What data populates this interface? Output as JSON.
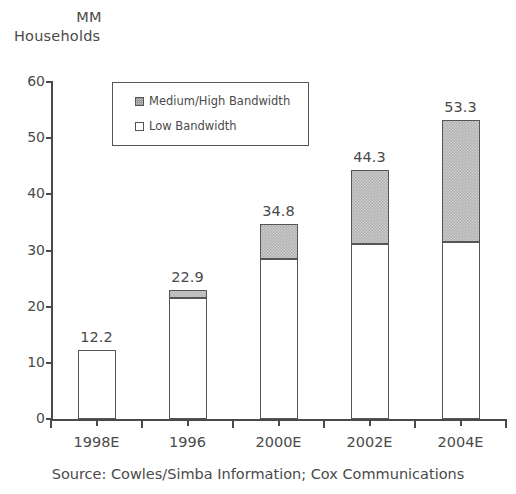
{
  "axis_title": {
    "line1": "MM",
    "line2": "Households"
  },
  "source": "Source: Cowles/Simba Information; Cox Communications",
  "legend": {
    "items": [
      {
        "label": "Medium/High Bandwidth",
        "swatch": "gray-hatched-square-icon",
        "color": "#b3b3b3"
      },
      {
        "label": "Low Bandwidth",
        "swatch": "white-square-icon",
        "color": "#ffffff"
      }
    ]
  },
  "chart_data": {
    "type": "bar",
    "subtype": "stacked",
    "title": "MM Households",
    "xlabel": "",
    "ylabel": "MM Households",
    "ylim": [
      0,
      60
    ],
    "yticks": [
      0,
      10,
      20,
      30,
      40,
      50,
      60
    ],
    "ytick_labels": [
      "0",
      "10",
      "20",
      "30",
      "40",
      "50",
      "60"
    ],
    "grid": false,
    "legend_position": "inside-top-left",
    "categories": [
      "1998E",
      "1996",
      "2000E",
      "2002E",
      "2004E"
    ],
    "series": [
      {
        "name": "Low Bandwidth",
        "color": "#ffffff",
        "values": [
          12.2,
          21.5,
          28.5,
          31.2,
          31.6
        ]
      },
      {
        "name": "Medium/High Bandwidth",
        "color": "#b3b3b3",
        "values": [
          0.0,
          1.4,
          6.3,
          13.1,
          21.7
        ]
      }
    ],
    "totals": [
      12.2,
      22.9,
      34.8,
      44.3,
      53.3
    ],
    "data_labels": [
      "12.2",
      "22.9",
      "34.8",
      "44.3",
      "53.3"
    ],
    "annotations": [
      "Source: Cowles/Simba Information; Cox Communications"
    ]
  }
}
